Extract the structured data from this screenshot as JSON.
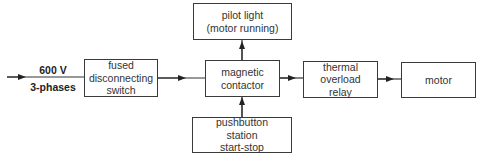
{
  "input": {
    "voltage": "600 V",
    "phases": "3-phases"
  },
  "blocks": {
    "fused_switch": [
      "fused",
      "disconnecting",
      "switch"
    ],
    "pilot_light": [
      "pilot light",
      "(motor running)"
    ],
    "magnetic_contactor": [
      "magnetic",
      "contactor"
    ],
    "pushbutton_station": [
      "pushbutton",
      "station",
      "start-stop"
    ],
    "thermal_overload_relay": [
      "thermal",
      "overload",
      "relay"
    ],
    "motor": [
      "motor"
    ]
  },
  "colors": {
    "line": "#333333",
    "box_border": "#3a3a3a",
    "background": "#ffffff"
  }
}
